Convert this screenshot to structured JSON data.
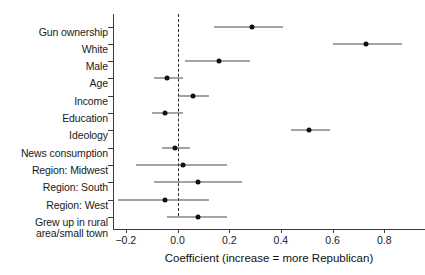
{
  "chart_data": {
    "type": "scatter",
    "title": "",
    "xlabel": "Coefficient (increase = more Republican)",
    "ylabel": "",
    "xlim": [
      -0.3,
      0.95
    ],
    "xticks": [
      -0.2,
      0.0,
      0.2,
      0.4,
      0.6,
      0.8
    ],
    "xticklabels": [
      "−0.2",
      "0.0",
      "0.2",
      "0.4",
      "0.6",
      "0.8"
    ],
    "grid": false,
    "legend": null,
    "reference_line": {
      "value": 0.0,
      "style": "dashed"
    },
    "categories": [
      "Gun ownership",
      "White",
      "Male",
      "Age",
      "Income",
      "Education",
      "Ideology",
      "News consumption",
      "Region: Midwest",
      "Region: South",
      "Region: West",
      "Grew up in rural\narea/small town"
    ],
    "values": [
      0.29,
      0.73,
      0.16,
      -0.04,
      0.06,
      -0.05,
      0.51,
      -0.01,
      0.02,
      0.08,
      -0.05,
      0.08
    ],
    "ci_lower": [
      0.14,
      0.6,
      0.03,
      -0.09,
      0.0,
      -0.1,
      0.44,
      -0.06,
      -0.16,
      -0.09,
      -0.23,
      -0.04
    ],
    "ci_upper": [
      0.41,
      0.87,
      0.28,
      0.02,
      0.12,
      0.02,
      0.59,
      0.05,
      0.19,
      0.25,
      0.12,
      0.19
    ],
    "point_color": "#111111",
    "line_color": "#4a4a4a"
  },
  "axis": {
    "x_title": "Coefficient (increase = more Republican)"
  }
}
